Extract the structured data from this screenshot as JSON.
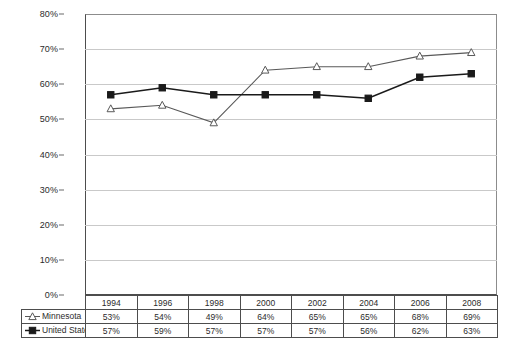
{
  "chart_data": {
    "type": "line",
    "title": "",
    "xlabel": "",
    "ylabel": "",
    "ylim": [
      0,
      80
    ],
    "y_tick_labels": [
      "80%",
      "70%",
      "60%",
      "50%",
      "40%",
      "30%",
      "20%",
      "10%",
      "0%"
    ],
    "y_ticks": [
      80,
      70,
      60,
      50,
      40,
      30,
      20,
      10,
      0
    ],
    "grid": true,
    "legend_position": "row-header-table",
    "categories": [
      "1994",
      "1996",
      "1998",
      "2000",
      "2002",
      "2004",
      "2006",
      "2008"
    ],
    "series": [
      {
        "name": "Minnesota",
        "marker": "triangle-open",
        "color": "#595959",
        "values": [
          53,
          54,
          49,
          64,
          65,
          65,
          68,
          69
        ],
        "labels": [
          "53%",
          "54%",
          "49%",
          "64%",
          "65%",
          "65%",
          "68%",
          "69%"
        ]
      },
      {
        "name": "United States",
        "marker": "square-filled",
        "color": "#1a1a1a",
        "values": [
          57,
          59,
          57,
          57,
          57,
          56,
          62,
          63
        ],
        "labels": [
          "57%",
          "59%",
          "57%",
          "57%",
          "57%",
          "56%",
          "62%",
          "63%"
        ]
      }
    ]
  },
  "table": {
    "year_header": [
      "1994",
      "1996",
      "1998",
      "2000",
      "2002",
      "2004",
      "2006",
      "2008"
    ],
    "rows": [
      {
        "legend_label": "Minnesota",
        "marker": "triangle-open",
        "values": [
          "53%",
          "54%",
          "49%",
          "64%",
          "65%",
          "65%",
          "68%",
          "69%"
        ]
      },
      {
        "legend_label": "United States",
        "marker": "square-filled",
        "values": [
          "57%",
          "59%",
          "57%",
          "57%",
          "57%",
          "56%",
          "62%",
          "63%"
        ]
      }
    ]
  },
  "colors": {
    "minnesota_line": "#595959",
    "united_states_line": "#1a1a1a",
    "gridline": "#c9c9c9",
    "axis": "#4d4d4d",
    "background": "#ffffff"
  }
}
